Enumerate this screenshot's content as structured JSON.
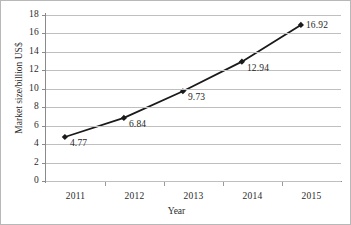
{
  "chart_data": {
    "type": "line",
    "title": "",
    "subtitle": "",
    "xlabel": "Year",
    "ylabel": "Market size/billion US$",
    "categories": [
      "2011",
      "2012",
      "2013",
      "2014",
      "2015"
    ],
    "values": [
      4.77,
      6.84,
      9.73,
      12.94,
      16.92
    ],
    "point_labels": [
      "4.77",
      "6.84",
      "9.73",
      "12.94",
      "16.92"
    ],
    "series": [
      {
        "name": "Market size",
        "values": [
          4.77,
          6.84,
          9.73,
          12.94,
          16.92
        ]
      }
    ],
    "ylim": [
      0,
      18
    ],
    "ytick_step": 2,
    "yticks": [
      "0",
      "2",
      "4",
      "6",
      "8",
      "10",
      "12",
      "14",
      "16",
      "18"
    ],
    "xticks": [
      "2011",
      "2012",
      "2013",
      "2014",
      "2015"
    ],
    "grid": "horizontal",
    "legend": "none",
    "marker": "diamond",
    "line_color": "#1a1a1a",
    "marker_color": "#1a1a1a",
    "grid_color": "#bfbfbf",
    "axis_color": "#8a8a8a",
    "text_color": "#2b2b2b",
    "background": "#ffffff"
  }
}
